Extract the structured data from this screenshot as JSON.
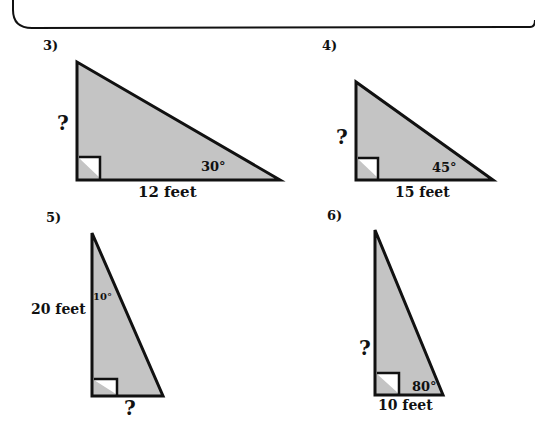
{
  "page": {
    "type": "worksheet",
    "topic": "right triangle trigonometry"
  },
  "problems": [
    {
      "number": "3)",
      "unknown_label": "?",
      "known_side": "12 feet",
      "angle": "30°"
    },
    {
      "number": "4)",
      "unknown_label": "?",
      "known_side": "15 feet",
      "angle": "45°"
    },
    {
      "number": "5)",
      "unknown_label": "?",
      "known_side": "20 feet",
      "angle": "10°"
    },
    {
      "number": "6)",
      "unknown_label": "?",
      "known_side": "10 feet",
      "angle": "80°"
    }
  ],
  "colors": {
    "triangle_fill": "#c4c4c4",
    "stroke": "#111111"
  }
}
